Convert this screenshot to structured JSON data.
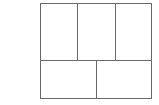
{
  "diagram": {
    "stroke_color": "#6a6a6a",
    "background_color": "#ffffff",
    "rows": [
      {
        "name": "top-row",
        "panels": [
          {
            "id": "panel-top-left",
            "label": ""
          },
          {
            "id": "panel-top-middle",
            "label": ""
          },
          {
            "id": "panel-top-right",
            "label": ""
          }
        ]
      },
      {
        "name": "bottom-row",
        "panels": [
          {
            "id": "panel-bottom-left",
            "label": ""
          },
          {
            "id": "panel-bottom-right",
            "label": ""
          }
        ]
      }
    ]
  }
}
